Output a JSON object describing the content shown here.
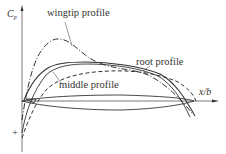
{
  "diagram": {
    "y_axis_label": "C",
    "y_axis_label_subscript": "p",
    "x_axis_label": "x/b",
    "sign_marker": "+",
    "curves": [
      {
        "name": "wingtip profile",
        "style": "dash-dot",
        "color": "#333333"
      },
      {
        "name": "root profile",
        "style": "dashed",
        "color": "#333333"
      },
      {
        "name": "middle profile",
        "style": "solid",
        "color": "#333333"
      }
    ],
    "labels": {
      "wingtip": "wingtip profile",
      "root": "root profile",
      "middle": "middle profile"
    },
    "airfoil_outline": "thin solid lens shape along x-axis"
  }
}
